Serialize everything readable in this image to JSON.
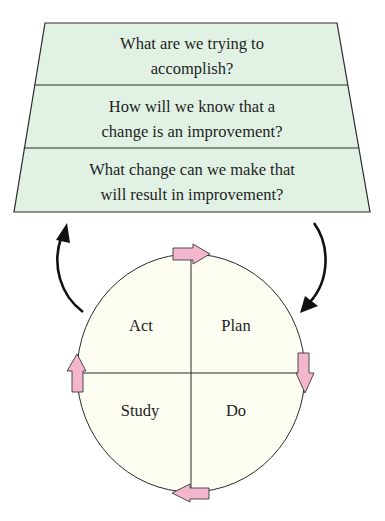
{
  "diagram": {
    "questions": [
      {
        "line1": "What are we trying to",
        "line2": "accomplish?"
      },
      {
        "line1": "How will we know that a",
        "line2": "change is an improvement?"
      },
      {
        "line1": "What change can we make that",
        "line2": "will result in improvement?"
      }
    ],
    "cycle": {
      "quadrants": {
        "top_left": "Act",
        "top_right": "Plan",
        "bottom_left": "Study",
        "bottom_right": "Do"
      },
      "direction": "clockwise"
    },
    "colors": {
      "question_fill": "#e1f2e5",
      "circle_fill": "#fdfdf1",
      "arrow_fill": "#f4b6cc",
      "stroke": "#2a2a2a"
    }
  }
}
